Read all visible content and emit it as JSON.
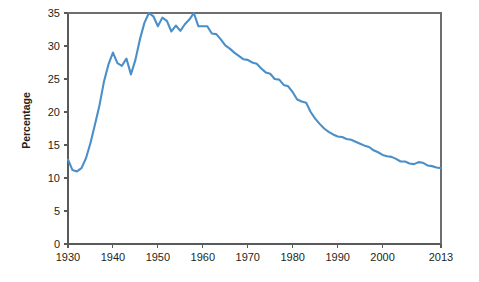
{
  "chart_data": {
    "type": "line",
    "title": "",
    "xlabel": "",
    "ylabel": "Percentage",
    "xlim": [
      1930,
      2013
    ],
    "ylim": [
      0,
      35
    ],
    "grid": false,
    "legend": null,
    "line_color": "#4a8fc9",
    "x_ticks": [
      1930,
      1940,
      1950,
      1960,
      1970,
      1980,
      1990,
      2000,
      2013
    ],
    "x_tick_labels": [
      "1930",
      "1940",
      "1950",
      "1960",
      "1970",
      "1980",
      "1990",
      "2000",
      "2013"
    ],
    "y_ticks": [
      0,
      5,
      10,
      15,
      20,
      25,
      30,
      35
    ],
    "y_tick_labels": [
      "0",
      "5",
      "10",
      "15",
      "20",
      "25",
      "30",
      "35"
    ],
    "series": [
      {
        "name": "Percentage",
        "x": [
          1930,
          1931,
          1932,
          1933,
          1934,
          1935,
          1936,
          1937,
          1938,
          1939,
          1940,
          1941,
          1942,
          1943,
          1944,
          1945,
          1946,
          1947,
          1948,
          1949,
          1950,
          1951,
          1952,
          1953,
          1954,
          1955,
          1956,
          1957,
          1958,
          1959,
          1960,
          1961,
          1962,
          1963,
          1964,
          1965,
          1966,
          1967,
          1968,
          1969,
          1970,
          1971,
          1972,
          1973,
          1974,
          1975,
          1976,
          1977,
          1978,
          1979,
          1980,
          1981,
          1982,
          1983,
          1984,
          1985,
          1986,
          1987,
          1988,
          1989,
          1990,
          1991,
          1992,
          1993,
          1994,
          1995,
          1996,
          1997,
          1998,
          1999,
          2000,
          2001,
          2002,
          2003,
          2004,
          2005,
          2006,
          2007,
          2008,
          2009,
          2010,
          2011,
          2012,
          2013
        ],
        "values": [
          12.8,
          11.2,
          11.0,
          11.5,
          13.0,
          15.3,
          18.1,
          21.0,
          24.6,
          27.2,
          29.0,
          27.4,
          27.0,
          28.1,
          25.7,
          27.9,
          31.0,
          33.5,
          35.0,
          34.5,
          33.0,
          34.3,
          33.8,
          32.2,
          33.1,
          32.3,
          33.3,
          34.0,
          35.0,
          33.0,
          33.0,
          33.0,
          31.9,
          31.8,
          31.0,
          30.1,
          29.6,
          29.0,
          28.5,
          28.0,
          27.9,
          27.5,
          27.3,
          26.6,
          26.0,
          25.8,
          25.0,
          24.9,
          24.1,
          23.9,
          23.0,
          21.9,
          21.6,
          21.4,
          20.0,
          19.0,
          18.2,
          17.5,
          17.0,
          16.6,
          16.3,
          16.2,
          15.9,
          15.8,
          15.5,
          15.2,
          14.9,
          14.7,
          14.2,
          13.9,
          13.5,
          13.3,
          13.2,
          12.9,
          12.5,
          12.5,
          12.2,
          12.1,
          12.4,
          12.3,
          11.9,
          11.8,
          11.6,
          11.5
        ]
      }
    ]
  },
  "plot_geometry": {
    "left": 68,
    "right": 441,
    "top": 13,
    "bottom": 244
  }
}
